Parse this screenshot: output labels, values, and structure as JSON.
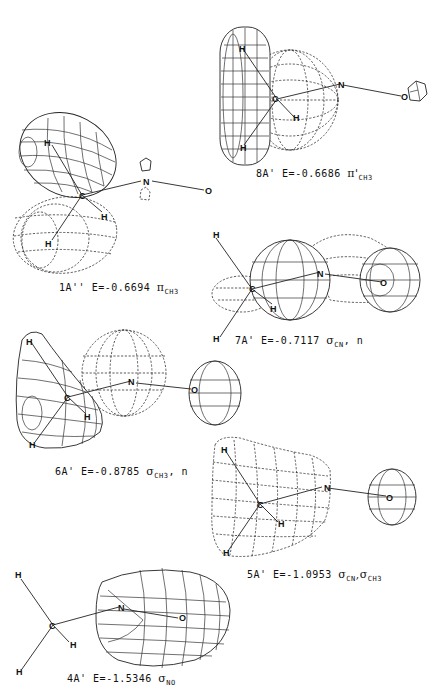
{
  "figure": {
    "panels": [
      {
        "id": "1A''",
        "label": "1A''",
        "energy": "E=-0.6694",
        "orbital_symbol": "π",
        "orbital_subscript": "CH3",
        "orbital_extra": "",
        "atoms": [
          "H",
          "C",
          "H",
          "N",
          "O"
        ]
      },
      {
        "id": "8A'",
        "label": "8A'",
        "energy": "E=-0.6686",
        "orbital_symbol": "π'",
        "orbital_subscript": "CH3",
        "orbital_extra": "",
        "atoms": [
          "H",
          "C",
          "H",
          "H",
          "N",
          "O"
        ]
      },
      {
        "id": "7A'",
        "label": "7A'",
        "energy": "E=-0.7117",
        "orbital_symbol": "σ",
        "orbital_subscript": "CN",
        "orbital_extra": ", n",
        "atoms": [
          "H",
          "C",
          "H",
          "H",
          "N",
          "O"
        ]
      },
      {
        "id": "6A'",
        "label": "6A'",
        "energy": "E=-0.8785",
        "orbital_symbol": "σ",
        "orbital_subscript": "CH3",
        "orbital_extra": ", n",
        "atoms": [
          "H",
          "C",
          "H",
          "H",
          "N",
          "O"
        ]
      },
      {
        "id": "5A'",
        "label": "5A'",
        "energy": "E=-1.0953",
        "orbital_symbol": "σ",
        "orbital_subscript": "CN",
        "orbital_extra": ",σ",
        "orbital_extra_subscript": "CH3",
        "atoms": [
          "H",
          "C",
          "H",
          "H",
          "N",
          "O"
        ]
      },
      {
        "id": "4A'",
        "label": "4A'",
        "energy": "E=-1.5346",
        "orbital_symbol": "σ",
        "orbital_subscript": "NO",
        "orbital_extra": "",
        "atoms": [
          "H",
          "C",
          "H",
          "H",
          "N",
          "O"
        ]
      }
    ],
    "atom_labels": {
      "H": "H",
      "C": "C",
      "N": "N",
      "O": "O"
    },
    "colors": {
      "ink": "#111111",
      "background": "#ffffff"
    }
  }
}
